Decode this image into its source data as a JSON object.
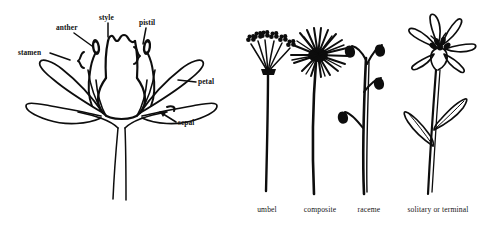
{
  "figure": {
    "background_color": "#ffffff",
    "ink_color": "#0d0d0d"
  },
  "flower_diagram": {
    "name": "longitudinal-section-of-flower",
    "labels": [
      {
        "id": "stamen",
        "text": "stamen",
        "x": 18,
        "y": 55,
        "anchor": "start"
      },
      {
        "id": "anther",
        "text": "anther",
        "x": 56,
        "y": 30,
        "anchor": "start"
      },
      {
        "id": "style",
        "text": "style",
        "x": 99,
        "y": 20,
        "anchor": "start"
      },
      {
        "id": "pistil",
        "text": "pistil",
        "x": 139,
        "y": 25,
        "anchor": "start"
      },
      {
        "id": "petal",
        "text": "petal",
        "x": 198,
        "y": 84,
        "anchor": "start"
      },
      {
        "id": "sepal",
        "text": "sepal",
        "x": 178,
        "y": 125,
        "anchor": "start"
      }
    ]
  },
  "inflorescences": {
    "items": [
      {
        "id": "umbel",
        "caption": "umbel",
        "caption_x": 267,
        "caption_y": 212
      },
      {
        "id": "composite",
        "caption": "composite",
        "caption_x": 320,
        "caption_y": 212
      },
      {
        "id": "raceme",
        "caption": "raceme",
        "caption_x": 369,
        "caption_y": 212
      },
      {
        "id": "solitary",
        "caption": "solitary or terminal",
        "caption_x": 438,
        "caption_y": 212
      }
    ]
  }
}
